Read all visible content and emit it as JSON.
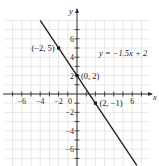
{
  "chart_data": {
    "type": "line",
    "title": "",
    "equation_label": "y = −1.5x  + 2",
    "xlabel": "x",
    "ylabel": "y",
    "xlim": [
      -7.8,
      7.8
    ],
    "ylim": [
      -7.8,
      8.2
    ],
    "grid": true,
    "x_tick_labels": [
      {
        "value": -6,
        "label": "−6"
      },
      {
        "value": -4,
        "label": "−4"
      },
      {
        "value": -2,
        "label": "−2"
      },
      {
        "value": 0,
        "label": "0"
      },
      {
        "value": 6,
        "label": "6"
      }
    ],
    "y_tick_labels": [
      {
        "value": 6,
        "label": "6"
      },
      {
        "value": 4,
        "label": "4"
      },
      {
        "value": 2,
        "label": "2"
      },
      {
        "value": -2,
        "label": "−2"
      },
      {
        "value": -4,
        "label": "−4"
      },
      {
        "value": -6,
        "label": "−6"
      }
    ],
    "series": [
      {
        "name": "y = -1.5x + 2",
        "slope": -1.5,
        "intercept": 2,
        "x": [
          -4,
          6.5
        ],
        "y": [
          8,
          -7.75
        ]
      }
    ],
    "points": [
      {
        "x": -2,
        "y": 5,
        "label": "(−2, 5)"
      },
      {
        "x": 0,
        "y": 2,
        "label": "(0, 2)"
      },
      {
        "x": 2,
        "y": -1,
        "label": "(2, −1)"
      }
    ],
    "colors": {
      "line": "#1a1a1a",
      "grid": "#d9d9d9",
      "axis": "#333333"
    }
  }
}
